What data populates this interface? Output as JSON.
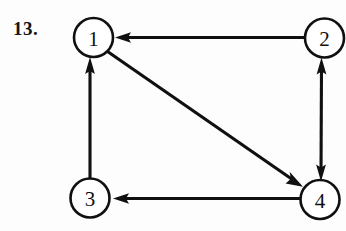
{
  "figure": {
    "problem_number": "13.",
    "type": "directed-graph",
    "background_color": "#fdfdfd",
    "ink_color": "#101010"
  },
  "nodes": [
    {
      "id": "1",
      "label": "1",
      "cx": 93.5,
      "cy": 37.5,
      "r": 19.5
    },
    {
      "id": "2",
      "label": "2",
      "cx": 324.5,
      "cy": 38.0,
      "r": 19.5
    },
    {
      "id": "3",
      "label": "3",
      "cx": 90.0,
      "cy": 198.0,
      "r": 19.5
    },
    {
      "id": "4",
      "label": "4",
      "cx": 320.0,
      "cy": 199.5,
      "r": 19.5
    }
  ],
  "edges": [
    {
      "id": "e-2-1",
      "from": "2",
      "to": "1",
      "direction": "one-way",
      "shape": "horizontal-top",
      "arrow_at": "1"
    },
    {
      "id": "e-3-1",
      "from": "3",
      "to": "1",
      "direction": "one-way",
      "shape": "vertical-left",
      "arrow_at": "1"
    },
    {
      "id": "e-1-4",
      "from": "1",
      "to": "4",
      "direction": "one-way",
      "shape": "diagonal",
      "arrow_at": "4"
    },
    {
      "id": "e-2-4",
      "from": "2",
      "to": "4",
      "direction": "two-way",
      "shape": "vertical-right",
      "arrow_at": "both"
    },
    {
      "id": "e-4-3",
      "from": "4",
      "to": "3",
      "direction": "one-way",
      "shape": "horizontal-bottom",
      "arrow_at": "3"
    }
  ]
}
